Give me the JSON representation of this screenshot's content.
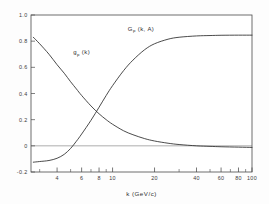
{
  "chart_data": {
    "type": "line",
    "title": "",
    "xlabel": "k (GeV/c)",
    "ylabel": "",
    "xscale": "log",
    "yscale": "linear",
    "xlim": [
      2.6,
      100
    ],
    "ylim": [
      -0.2,
      1.0
    ],
    "grid": false,
    "legend_position": "inline-annotations",
    "xticks_major": [
      4,
      6,
      8,
      10,
      20,
      40,
      60,
      80,
      100
    ],
    "xtick_labels": [
      "4",
      "6",
      "8",
      "10",
      "20",
      "40",
      "60",
      "80",
      "100"
    ],
    "xticks_minor": [
      3,
      5,
      7,
      9,
      30,
      50,
      70,
      90
    ],
    "yticks": [
      -0.2,
      0,
      0.2,
      0.4,
      0.6,
      0.8,
      1.0
    ],
    "ytick_labels": [
      "-0.2",
      "0",
      "0.2",
      "0.4",
      "0.6",
      "0.8",
      "1.0"
    ],
    "annotations": [
      {
        "text_main": "g",
        "text_sub": "p",
        "text_tail": " (k)",
        "x": 6.0,
        "y": 0.7
      },
      {
        "text_main": "G",
        "text_sub": "p",
        "text_tail": " (k, A)",
        "x": 16.0,
        "y": 0.88
      }
    ],
    "series": [
      {
        "name": "g_p (k)",
        "label_main": "g",
        "label_sub": "p",
        "label_tail": " (k)",
        "color": "#2a2a2a",
        "x": [
          2.7,
          3.0,
          3.5,
          4.0,
          4.5,
          5.0,
          5.5,
          6.0,
          7.0,
          8.0,
          9.0,
          10.0,
          12.0,
          14.0,
          17.0,
          20.0,
          25.0,
          30.0,
          40.0,
          50.0,
          60.0,
          80.0,
          100.0
        ],
        "y": [
          0.83,
          0.78,
          0.7,
          0.62,
          0.555,
          0.49,
          0.435,
          0.385,
          0.305,
          0.245,
          0.2,
          0.165,
          0.115,
          0.085,
          0.055,
          0.037,
          0.02,
          0.01,
          0.0,
          -0.004,
          -0.007,
          -0.01,
          -0.012
        ]
      },
      {
        "name": "G_p (k, A)",
        "label_main": "G",
        "label_sub": "p",
        "label_tail": " (k, A)",
        "color": "#2a2a2a",
        "x": [
          2.7,
          3.0,
          3.5,
          4.0,
          4.5,
          5.0,
          5.5,
          6.0,
          7.0,
          8.0,
          9.0,
          10.0,
          12.0,
          14.0,
          17.0,
          20.0,
          25.0,
          30.0,
          40.0,
          50.0,
          60.0,
          80.0,
          100.0
        ],
        "y": [
          -0.125,
          -0.12,
          -0.112,
          -0.095,
          -0.065,
          -0.02,
          0.035,
          0.09,
          0.195,
          0.295,
          0.385,
          0.46,
          0.575,
          0.655,
          0.735,
          0.78,
          0.815,
          0.83,
          0.84,
          0.843,
          0.845,
          0.846,
          0.846
        ]
      }
    ],
    "zero_line": 0
  }
}
